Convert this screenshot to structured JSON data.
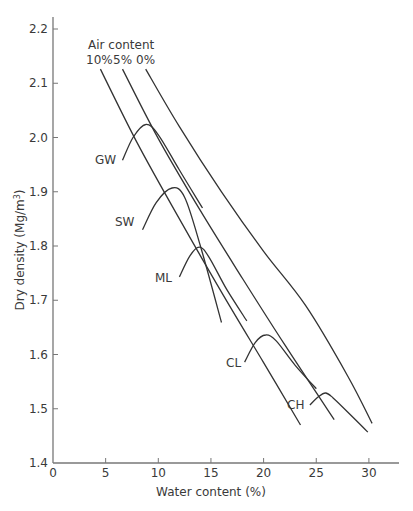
{
  "chart_data": {
    "type": "line",
    "title": "",
    "xlabel": "Water content (%)",
    "ylabel": "Dry density (Mg/m³)",
    "xlim": [
      0,
      33
    ],
    "ylim": [
      1.4,
      2.25
    ],
    "xticks": [
      0,
      5,
      10,
      15,
      20,
      25,
      30
    ],
    "yticks": [
      1.4,
      1.5,
      1.6,
      1.7,
      1.8,
      1.9,
      2.0,
      2.1,
      2.2
    ],
    "grid": false,
    "legend": "none",
    "annotations": {
      "air_content_title": "Air content",
      "air_labels": [
        "10%",
        "5%",
        "0%"
      ]
    },
    "series": [
      {
        "name": "0% air",
        "kind": "air-void line",
        "x": [
          8.8,
          12,
          16,
          20,
          24,
          28,
          30.3
        ],
        "y": [
          2.126,
          2.02,
          1.9,
          1.79,
          1.69,
          1.56,
          1.473
        ]
      },
      {
        "name": "5% air",
        "kind": "air-void line",
        "x": [
          6.6,
          10,
          14,
          18,
          22,
          26.7
        ],
        "y": [
          2.126,
          1.998,
          1.865,
          1.74,
          1.618,
          1.48
        ]
      },
      {
        "name": "10% air",
        "kind": "air-void line",
        "x": [
          4.5,
          8,
          12,
          16,
          20,
          23.5
        ],
        "y": [
          2.126,
          1.99,
          1.85,
          1.715,
          1.585,
          1.47
        ]
      },
      {
        "name": "GW",
        "kind": "compaction curve",
        "x": [
          6.6,
          7.6,
          8.8,
          10.0,
          12.0,
          14.2
        ],
        "y": [
          1.958,
          2.0,
          2.024,
          2.005,
          1.94,
          1.87
        ]
      },
      {
        "name": "SW",
        "kind": "compaction curve",
        "x": [
          8.5,
          9.8,
          11.3,
          12.5,
          14.0,
          16.0
        ],
        "y": [
          1.83,
          1.88,
          1.907,
          1.89,
          1.8,
          1.659
        ]
      },
      {
        "name": "ML",
        "kind": "compaction curve",
        "x": [
          12.0,
          13.0,
          13.9,
          14.8,
          16.5,
          18.4
        ],
        "y": [
          1.743,
          1.782,
          1.798,
          1.78,
          1.72,
          1.662
        ]
      },
      {
        "name": "CL",
        "kind": "compaction curve",
        "x": [
          18.2,
          19.2,
          20.2,
          21.2,
          23.0,
          25.0
        ],
        "y": [
          1.586,
          1.622,
          1.636,
          1.625,
          1.58,
          1.537
        ]
      },
      {
        "name": "CH",
        "kind": "compaction curve",
        "x": [
          24.4,
          25.2,
          25.9,
          26.6,
          28.2,
          29.9
        ],
        "y": [
          1.507,
          1.522,
          1.529,
          1.52,
          1.49,
          1.457
        ]
      }
    ]
  }
}
